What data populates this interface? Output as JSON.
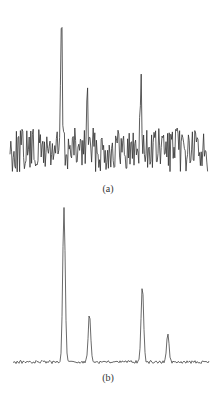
{
  "chart_data": [
    {
      "type": "line",
      "label": "(a)",
      "title": "",
      "xlabel": "",
      "ylabel": "",
      "grid": false,
      "axes_visible": false,
      "description": "Noisy spectrum with three peaks above a high-noise baseline",
      "x_range": [
        0,
        1
      ],
      "noise_level": "high",
      "peaks": [
        {
          "position": 0.26,
          "relative_height": 1.0
        },
        {
          "position": 0.39,
          "relative_height": 0.42
        },
        {
          "position": 0.66,
          "relative_height": 0.55
        }
      ]
    },
    {
      "type": "line",
      "label": "(b)",
      "title": "",
      "xlabel": "",
      "ylabel": "",
      "grid": false,
      "axes_visible": false,
      "description": "Denoised spectrum with four clean peaks above a low-noise flat baseline",
      "x_range": [
        0,
        1
      ],
      "noise_level": "low",
      "peaks": [
        {
          "position": 0.26,
          "relative_height": 1.0
        },
        {
          "position": 0.39,
          "relative_height": 0.31
        },
        {
          "position": 0.66,
          "relative_height": 0.49
        },
        {
          "position": 0.79,
          "relative_height": 0.18
        }
      ]
    }
  ],
  "labels": {
    "a": "(a)",
    "b": "(b)"
  },
  "colors": {
    "trace": "#333333",
    "background": "#ffffff"
  }
}
